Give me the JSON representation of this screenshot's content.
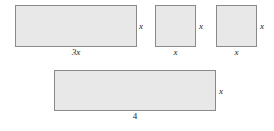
{
  "figure": {
    "background_color": "#ffffff",
    "shape_fill_color": "#e8e8e8",
    "shape_border_color": "#8a8a8a",
    "shapes": [
      {
        "name": "rectangle-3x-by-x",
        "kind": "rectangle",
        "width_label": "3x",
        "height_label": "x"
      },
      {
        "name": "square-x-by-x-first",
        "kind": "square",
        "width_label": "x",
        "height_label": "x"
      },
      {
        "name": "square-x-by-x-second",
        "kind": "square",
        "width_label": "x",
        "height_label": "x"
      },
      {
        "name": "rectangle-4-by-x",
        "kind": "rectangle",
        "width_label": "4",
        "height_label": "x"
      }
    ]
  }
}
